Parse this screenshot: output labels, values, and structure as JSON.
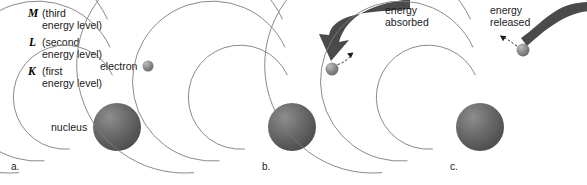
{
  "figure": {
    "background_color": "#ffffff",
    "width": 587,
    "height": 185
  },
  "colors": {
    "orbit_stroke": "#7d7d7d",
    "nucleus_dark": "#4f4f4f",
    "nucleus_light": "#8d8d8d",
    "electron_dark": "#6f6f6f",
    "electron_light": "#bdbdbd",
    "energy_arrow": "#4a4a4a",
    "jump_arrow": "#1c1c1c",
    "text": "#1a1a1a"
  },
  "energy_levels": [
    {
      "letter": "M",
      "description": "(third",
      "description_line2": "energy level)",
      "x": 28,
      "y": 17,
      "text_x": 42,
      "line2_x": 42,
      "line2_y": 29
    },
    {
      "letter": "L",
      "description": "(second",
      "description_line2": "energy level)",
      "x": 29,
      "y": 46,
      "text_x": 42,
      "line2_x": 42,
      "line2_y": 58
    },
    {
      "letter": "K",
      "description": "(first",
      "description_line2": "energy level)",
      "x": 28,
      "y": 75,
      "text_x": 42,
      "line2_x": 42,
      "line2_y": 87
    }
  ],
  "panels": [
    {
      "id": "panel-a",
      "letter": "a.",
      "letter_x": 11,
      "letter_y": 170,
      "center_x": 117,
      "center_y": 127,
      "nucleus_radius": 24,
      "orbit_radii": [
        52,
        80,
        108
      ],
      "electron": {
        "x": 148,
        "y": 66,
        "r": 5.5
      },
      "labels": [
        {
          "name": "nucleus-label",
          "text": "nucleus",
          "x": 51,
          "y": 131
        },
        {
          "name": "electron-label",
          "text": "electron",
          "x": 100,
          "y": 70
        }
      ]
    },
    {
      "id": "panel-b",
      "letter": "b.",
      "letter_x": 262,
      "letter_y": 170,
      "center_x": 292,
      "center_y": 127,
      "nucleus_radius": 24,
      "orbit_radii": [
        52,
        80,
        108
      ],
      "electron": {
        "x": 332,
        "y": 69,
        "r": 6.5
      },
      "callout": {
        "name": "energy-absorbed-label",
        "line1": "energy",
        "line2": "absorbed",
        "x": 385,
        "y": 14,
        "line2_y": 26
      },
      "energy_arrow_direction": "inward",
      "jump_direction": "outward"
    },
    {
      "id": "panel-c",
      "letter": "c.",
      "letter_x": 450,
      "letter_y": 170,
      "center_x": 480,
      "center_y": 127,
      "nucleus_radius": 24,
      "orbit_radii": [
        52,
        80,
        108
      ],
      "electron": {
        "x": 523,
        "y": 50,
        "r": 6.5
      },
      "callout": {
        "name": "energy-released-label",
        "line1": "energy",
        "line2": "released",
        "x": 490,
        "y": 14,
        "line2_y": 26
      },
      "energy_arrow_direction": "outward",
      "jump_direction": "inward"
    }
  ]
}
